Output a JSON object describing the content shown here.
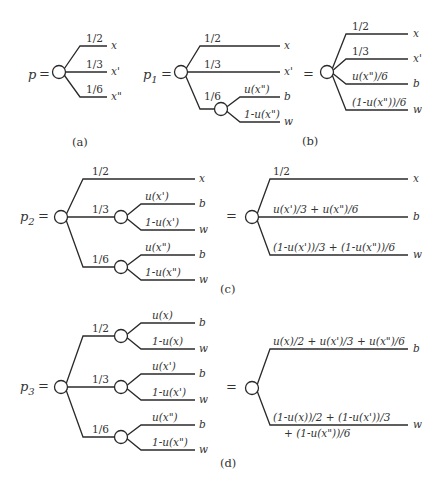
{
  "figure": {
    "panels": [
      {
        "id": "a",
        "caption": "(a)",
        "lottery": {
          "name": "p",
          "equals": "="
        },
        "branches": [
          {
            "prob": "1/2",
            "outcome": "x"
          },
          {
            "prob": "1/3",
            "outcome": "x'"
          },
          {
            "prob": "1/6",
            "outcome": "x\""
          }
        ]
      },
      {
        "id": "b",
        "caption": "(b)",
        "lottery": {
          "name": "p",
          "subscript": "1",
          "equals": "="
        },
        "left_branches": [
          {
            "prob": "1/2",
            "outcome": "x"
          },
          {
            "prob": "1/3",
            "outcome": "x'"
          },
          {
            "prob": "1/6",
            "sub_branches": [
              {
                "prob": "u(x\")",
                "outcome": "b"
              },
              {
                "prob": "1-u(x\")",
                "outcome": "w"
              }
            ]
          }
        ],
        "reduced_equals": "=",
        "reduced_branches": [
          {
            "prob": "1/2",
            "outcome": "x"
          },
          {
            "prob": "1/3",
            "outcome": "x'"
          },
          {
            "prob": "u(x\")/6",
            "outcome": "b"
          },
          {
            "prob": "(1-u(x\"))/6",
            "outcome": "w"
          }
        ]
      },
      {
        "id": "c",
        "caption": "(c)",
        "lottery": {
          "name": "p",
          "subscript": "2",
          "equals": "="
        },
        "left_branches": [
          {
            "prob": "1/2",
            "outcome": "x"
          },
          {
            "prob": "1/3",
            "sub_branches": [
              {
                "prob": "u(x')",
                "outcome": "b"
              },
              {
                "prob": "1-u(x')",
                "outcome": "w"
              }
            ]
          },
          {
            "prob": "1/6",
            "sub_branches": [
              {
                "prob": "u(x\")",
                "outcome": "b"
              },
              {
                "prob": "1-u(x\")",
                "outcome": "w"
              }
            ]
          }
        ],
        "reduced_equals": "=",
        "reduced_branches": [
          {
            "prob": "1/2",
            "outcome": "x"
          },
          {
            "prob": "u(x')/3 + u(x\")/6",
            "outcome": "b"
          },
          {
            "prob": "(1-u(x'))/3 + (1-u(x\"))/6",
            "outcome": "w"
          }
        ]
      },
      {
        "id": "d",
        "caption": "(d)",
        "lottery": {
          "name": "p",
          "subscript": "3",
          "equals": "="
        },
        "left_branches": [
          {
            "prob": "1/2",
            "sub_branches": [
              {
                "prob": "u(x)",
                "outcome": "b"
              },
              {
                "prob": "1-u(x)",
                "outcome": "w"
              }
            ]
          },
          {
            "prob": "1/3",
            "sub_branches": [
              {
                "prob": "u(x')",
                "outcome": "b"
              },
              {
                "prob": "1-u(x')",
                "outcome": "w"
              }
            ]
          },
          {
            "prob": "1/6",
            "sub_branches": [
              {
                "prob": "u(x\")",
                "outcome": "b"
              },
              {
                "prob": "1-u(x\")",
                "outcome": "w"
              }
            ]
          }
        ],
        "reduced_equals": "=",
        "reduced_branches": [
          {
            "prob": "u(x)/2 + u(x')/3 + u(x\")/6",
            "outcome": "b"
          },
          {
            "prob_line1": "(1-u(x))/2 + (1-u(x'))/3",
            "prob_line2": "+ (1-u(x\"))/6",
            "outcome": "w"
          }
        ]
      }
    ]
  }
}
